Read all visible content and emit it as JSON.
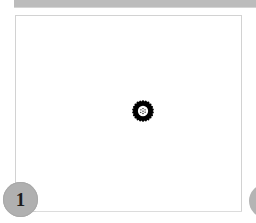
{
  "window": {
    "title": "",
    "background_color": "#ffffff"
  },
  "header": {
    "strip_color": "#bcbcbc",
    "label": ""
  },
  "content_panel": {
    "border_color": "#d2d2d2",
    "background_color": "#ffffff",
    "artwork": {
      "icon": "flower-icon",
      "description": "daisy flower clipart",
      "color": "#000000",
      "petal_count": 22,
      "center_dot_count": 7
    }
  },
  "steps": {
    "current": {
      "number": "1",
      "badge_color": "#b0b0b0",
      "text_color": "#1c1c1c"
    },
    "next": {
      "number": "",
      "badge_color": "#b4b4b4"
    }
  },
  "connector": {
    "color": "#dcdcdc"
  }
}
